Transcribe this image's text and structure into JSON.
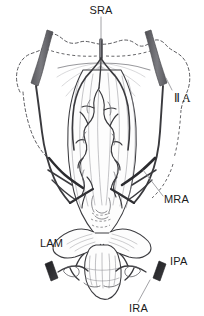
{
  "figure": {
    "background_color": "#ffffff",
    "width": 204,
    "height": 316
  },
  "palette": {
    "vessel_major": "#6e6e72",
    "vessel_major_dark": "#4d4d52",
    "vessel_thin": "#3a3a3e",
    "outline": "#3c3c40",
    "stump": "#2b2b2e",
    "bone_dashed": "#4a4a4e",
    "fan_shading": "#b9b9bd",
    "organ_fill": "#fdfdfd",
    "label_text": "#1a1a1a"
  },
  "labels": [
    {
      "id": "sra",
      "text": "SRA",
      "meaning": "superior rectal artery",
      "x": 101,
      "y": 13,
      "anchor": "middle",
      "leader": {
        "x1": 101,
        "y1": 17,
        "x2": 101,
        "y2": 55
      }
    },
    {
      "id": "iia",
      "text": "Ⅱ A",
      "meaning": "internal iliac artery",
      "x": 174,
      "y": 100,
      "anchor": "start",
      "leader": {
        "x1": 172,
        "y1": 90,
        "x2": 166,
        "y2": 78
      }
    },
    {
      "id": "mra",
      "text": "MRA",
      "meaning": "middle rectal artery",
      "x": 164,
      "y": 201,
      "anchor": "start",
      "leader": {
        "x1": 163,
        "y1": 196,
        "x2": 144,
        "y2": 168
      }
    },
    {
      "id": "lam",
      "text": "LAM",
      "meaning": "levator ani muscle",
      "x": 40,
      "y": 245,
      "anchor": "start",
      "leader": null
    },
    {
      "id": "ipa",
      "text": "IPA",
      "meaning": "internal pudendal artery",
      "x": 170,
      "y": 263,
      "anchor": "start",
      "leader": null
    },
    {
      "id": "ira",
      "text": "IRA",
      "meaning": "inferior rectal artery",
      "x": 129,
      "y": 310,
      "anchor": "start",
      "leader": {
        "x1": 138,
        "y1": 302,
        "x2": 150,
        "y2": 279
      }
    }
  ],
  "structures": {
    "pelvic_outline": "dashed bone silhouette",
    "superior_rectal_artery": "descends midline and bifurcates over rectum",
    "internal_iliac_arteries": "paired thick oblique bands, left and right",
    "middle_rectal_arteries": "paired branches entering mid rectum",
    "inferior_rectal_arteries": "paired branches at anal canal",
    "internal_pudendal_arteries": "cut stumps lateral to anal canal",
    "levator_ani_muscle": "fan shaped muscle at rectal base",
    "rectum": "vertically ridged tube with vascular plexus"
  }
}
